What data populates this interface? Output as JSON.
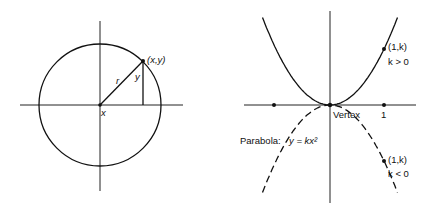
{
  "left_diagram": {
    "title": "Circle with point",
    "point_label": "(x,y)",
    "radius_label": "r",
    "height_label": "y",
    "base_label": "x"
  },
  "right_diagram": {
    "title": "Parabola",
    "upper_point_label": "(1,k)",
    "upper_condition": "k > 0",
    "lower_point_label": "(1,k)",
    "lower_condition": "k < 0",
    "vertex_label": "Vertex",
    "unit_tick_label": "1",
    "equation_prefix": "Parabola:",
    "equation": "y = kx²",
    "k_upper": 1,
    "k_lower": -1
  },
  "colors": {
    "ink": "#111111",
    "background": "#ffffff"
  }
}
